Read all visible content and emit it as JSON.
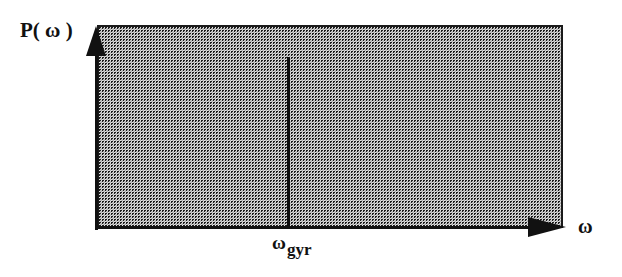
{
  "figure": {
    "width": 622,
    "height": 277,
    "background_color": "#ffffff",
    "ink_color": "#111111",
    "fill_color": "#f2f2f2"
  },
  "labels": {
    "y_axis": "P( ω )",
    "x_axis": "ω",
    "gyro_frequency_base": "ω",
    "gyro_frequency_subscript": "gyr"
  },
  "chart_data": {
    "type": "area",
    "title": "",
    "xlabel": "ω",
    "ylabel": "P( ω )",
    "grid": false,
    "legend": null,
    "xlim": [
      0,
      1
    ],
    "ylim": [
      0,
      1
    ],
    "axis_ticks": {
      "x": [
        "ω_gyr"
      ],
      "y": []
    },
    "series": [
      {
        "name": "Broadband power spectrum",
        "type": "area",
        "shading": "stipple",
        "x": [
          0,
          1
        ],
        "values": [
          1,
          1
        ],
        "description": "Flat (uniform) power spectral density spanning the whole frequency range"
      },
      {
        "name": "Gyro-frequency line",
        "type": "vertical-line",
        "x": 0.41,
        "value_top": 0.84,
        "label": "ω_gyr",
        "description": "Sharp spectral feature located at the gyro frequency"
      }
    ],
    "annotations": [
      {
        "text": "P( ω )",
        "position": "y-axis-top"
      },
      {
        "text": "ω",
        "position": "x-axis-right"
      },
      {
        "text": "ω_gyr",
        "position": "x-axis-below-spike"
      }
    ]
  }
}
